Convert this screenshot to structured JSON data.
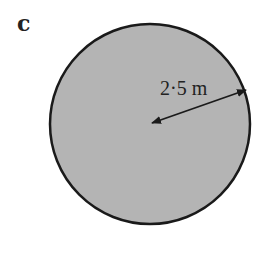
{
  "figure": {
    "label": "c",
    "shape": "circle",
    "fill_color": "#b4b4b4",
    "stroke_color": "#1a1a1a",
    "radius_label": "2·5 m",
    "radius_value": 2.5,
    "radius_unit": "m"
  }
}
